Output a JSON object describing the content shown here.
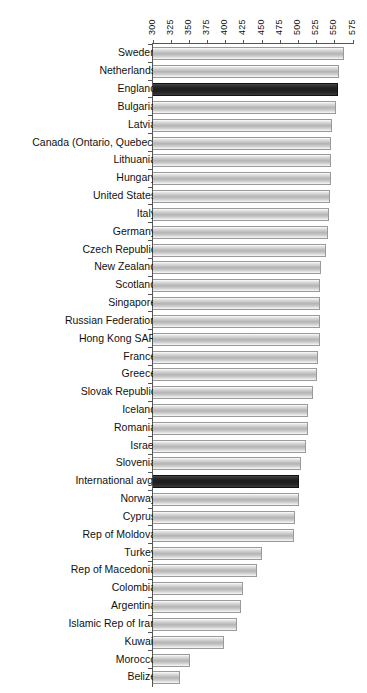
{
  "chart_data": {
    "type": "bar",
    "orientation": "horizontal",
    "title": "",
    "xlabel": "",
    "ylabel": "",
    "xlim": [
      300,
      575
    ],
    "xticks": [
      300,
      325,
      350,
      375,
      400,
      425,
      450,
      475,
      500,
      525,
      550,
      575
    ],
    "grid": false,
    "legend": null,
    "highlight_color": "#222222",
    "bar_color": "#c2c2c2",
    "categories": [
      "Sweden",
      "Netherlands",
      "England",
      "Bulgaria",
      "Latvia",
      "Canada (Ontario, Quebec)",
      "Lithuania",
      "Hungary",
      "United States",
      "Italy",
      "Germany",
      "Czech Republic",
      "New Zealand",
      "Scotland",
      "Singapore",
      "Russian Federation",
      "Hong Kong SAR",
      "France",
      "Greece",
      "Slovak Republic",
      "Iceland",
      "Romania",
      "Israel",
      "Slovenia",
      "International avg.",
      "Norway",
      "Cyprus",
      "Rep of Moldova",
      "Turkey",
      "Rep of Macedonia",
      "Colombia",
      "Argentina",
      "Islamic Rep of Iran",
      "Kuwait",
      "Morocco",
      "Belize"
    ],
    "values": [
      561,
      554,
      553,
      550,
      545,
      544,
      543,
      543,
      542,
      541,
      539,
      537,
      529,
      528,
      528,
      528,
      528,
      525,
      524,
      518,
      512,
      512,
      509,
      502,
      500,
      499,
      494,
      492,
      449,
      442,
      422,
      420,
      414,
      396,
      350,
      336
    ],
    "highlighted": [
      "England",
      "International avg."
    ]
  }
}
